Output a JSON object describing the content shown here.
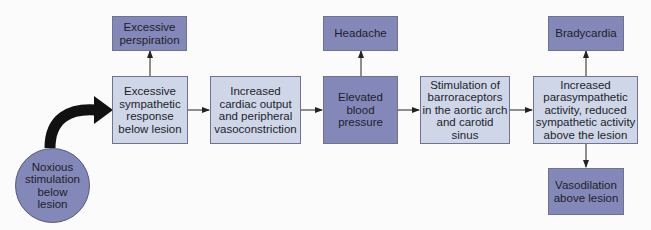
{
  "diagram": {
    "colors": {
      "light_box": "#ced6e8",
      "dark_box": "#8388b8",
      "arrow": "#222222"
    },
    "start": {
      "id": "noxious",
      "label": "Noxious stimulation below lesion"
    },
    "nodes": [
      {
        "id": "sympathetic",
        "label": "Excessive sympathetic response below lesion"
      },
      {
        "id": "cardiac",
        "label": "Increased cardiac output and peripheral vasoconstriction"
      },
      {
        "id": "bp",
        "label": "Elevated blood pressure"
      },
      {
        "id": "baro",
        "label": "Stimulation of barroraceptors in the aortic arch and carotid sinus"
      },
      {
        "id": "parasym",
        "label": "Increased parasympathetic activity, reduced sympathetic activity above the lesion"
      }
    ],
    "effects": [
      {
        "id": "perspiration",
        "label": "Excessive perspiration",
        "from": "sympathetic"
      },
      {
        "id": "headache",
        "label": "Headache",
        "from": "bp"
      },
      {
        "id": "bradycardia",
        "label": "Bradycardia",
        "from": "parasym"
      },
      {
        "id": "vasodilation",
        "label": "Vasodilation above lesion",
        "from": "parasym"
      }
    ],
    "edges": [
      [
        "noxious",
        "sympathetic"
      ],
      [
        "sympathetic",
        "cardiac"
      ],
      [
        "cardiac",
        "bp"
      ],
      [
        "bp",
        "baro"
      ],
      [
        "baro",
        "parasym"
      ],
      [
        "sympathetic",
        "perspiration"
      ],
      [
        "bp",
        "headache"
      ],
      [
        "parasym",
        "bradycardia"
      ],
      [
        "parasym",
        "vasodilation"
      ]
    ]
  }
}
